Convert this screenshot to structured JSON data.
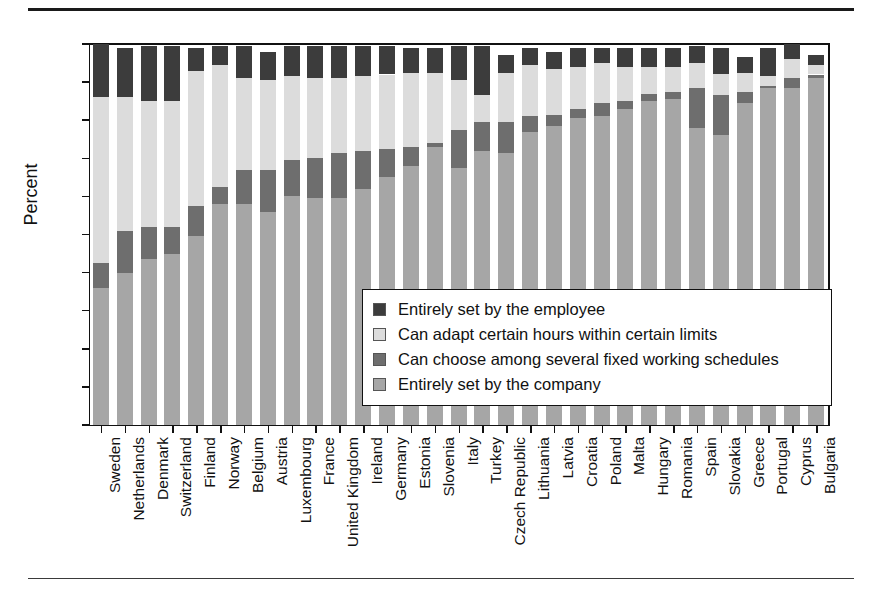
{
  "chart_data": {
    "type": "bar",
    "stacked": true,
    "title": "",
    "subtitle": "",
    "xlabel": "",
    "ylabel": "Percent",
    "ylim": [
      0,
      100
    ],
    "yticks": [
      0,
      10,
      20,
      30,
      40,
      50,
      60,
      70,
      80,
      90,
      100
    ],
    "ytick_labels": [
      "0",
      "10",
      "20",
      "30",
      "40",
      "50",
      "60",
      "70",
      "80",
      "90",
      "100"
    ],
    "grid": false,
    "legend_position": "inside-center-right",
    "legend_order_top_to_bottom": [
      "Entirely set by the employee",
      "Can adapt certain hours within certain limits",
      "Can choose among several fixed working schedules",
      "Entirely set by the company"
    ],
    "categories": [
      "Sweden",
      "Netherlands",
      "Denmark",
      "Switzerland",
      "Finland",
      "Norway",
      "Belgium",
      "Austria",
      "Luxembourg",
      "France",
      "United Kingdom",
      "Ireland",
      "Germany",
      "Estonia",
      "Slovenia",
      "Italy",
      "Turkey",
      "Czech Republic",
      "Lithuania",
      "Latvia",
      "Croatia",
      "Poland",
      "Malta",
      "Hungary",
      "Romania",
      "Spain",
      "Slovakia",
      "Greece",
      "Portugal",
      "Cyprus",
      "Bulgaria"
    ],
    "series": [
      {
        "name": "Entirely set by the company",
        "color": "#a6a6a6",
        "values": [
          36,
          40,
          43.5,
          45,
          49.5,
          58,
          58,
          56,
          60,
          59.5,
          59.5,
          62,
          65,
          68,
          73,
          67.5,
          72,
          71.5,
          77,
          78.5,
          80.5,
          81,
          83,
          85,
          85.5,
          78,
          76,
          84.5,
          88.5,
          88.5,
          91
        ]
      },
      {
        "name": "Can choose among several fixed working schedules",
        "color": "#6e6e6e",
        "values": [
          6.5,
          11,
          8.5,
          7,
          8,
          4.5,
          9,
          11,
          9.5,
          10.5,
          12,
          10,
          7.5,
          5,
          1,
          10,
          7.5,
          8,
          4,
          3,
          2.5,
          3.5,
          2,
          2,
          2,
          10.5,
          10.5,
          3,
          0.5,
          2.5,
          1
        ]
      },
      {
        "name": "Can adapt certain hours within certain limits",
        "color": "#dcdcdc",
        "values": [
          43.5,
          35,
          33,
          33,
          35.5,
          32,
          24,
          23.5,
          22,
          21,
          19.5,
          19.5,
          19.5,
          19.5,
          18.5,
          13,
          7,
          13,
          13.5,
          12,
          11,
          10.5,
          9,
          7,
          6.5,
          6.5,
          5.5,
          5,
          2.5,
          5,
          2.5
        ]
      },
      {
        "name": "Entirely set by the employee",
        "color": "#3c3c3c",
        "values": [
          14,
          13,
          14.5,
          14.5,
          6,
          5,
          8.5,
          7.5,
          8,
          8.5,
          8.5,
          8,
          7.5,
          6.5,
          6.5,
          9,
          13,
          4.5,
          4.5,
          4.5,
          5,
          4,
          5,
          5,
          5,
          4.5,
          7,
          4,
          7.5,
          4,
          2.5
        ]
      }
    ]
  },
  "legend": {
    "items": [
      {
        "label": "Entirely set by the employee",
        "color": "#3c3c3c"
      },
      {
        "label": "Can adapt certain hours within certain limits",
        "color": "#dcdcdc"
      },
      {
        "label": "Can choose among several fixed working schedules",
        "color": "#6e6e6e"
      },
      {
        "label": "Entirely set by the company",
        "color": "#a6a6a6"
      }
    ]
  }
}
